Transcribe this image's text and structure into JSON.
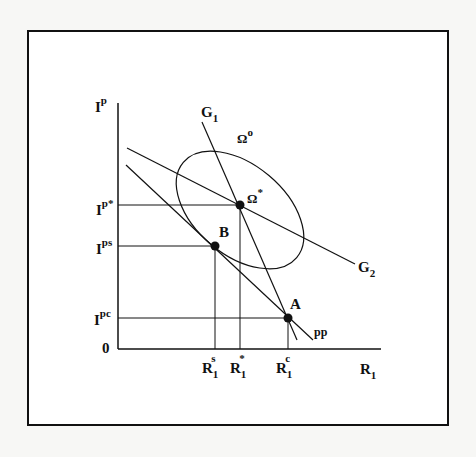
{
  "diagram": {
    "type": "economic-equilibrium-diagram",
    "axes": {
      "y_label": {
        "base": "I",
        "sup": "p"
      },
      "x_label": {
        "base": "R",
        "sub": "1"
      },
      "origin_label": "0"
    },
    "y_ticks": [
      {
        "id": "I_p_star",
        "base": "I",
        "sup": "p*"
      },
      {
        "id": "I_ps",
        "base": "I",
        "sup": "ps"
      },
      {
        "id": "I_pc",
        "base": "I",
        "sup": "pc"
      }
    ],
    "x_ticks": [
      {
        "id": "R1_s",
        "base": "R",
        "sub": "1",
        "sup": "s"
      },
      {
        "id": "R1_star",
        "base": "R",
        "sub": "1",
        "sup": "*"
      },
      {
        "id": "R1_c",
        "base": "R",
        "sub": "1",
        "sup": "c"
      }
    ],
    "curves": [
      {
        "id": "G1",
        "base": "G",
        "sub": "1",
        "kind": "line"
      },
      {
        "id": "G2",
        "base": "G",
        "sub": "2",
        "kind": "line"
      },
      {
        "id": "pp",
        "label": "pp",
        "kind": "line"
      },
      {
        "id": "Omega_o",
        "base": "Ω",
        "sup": "o",
        "kind": "ellipse"
      }
    ],
    "points": [
      {
        "id": "Omega_star",
        "base": "Ω",
        "sup": "*"
      },
      {
        "id": "B",
        "label": "B"
      },
      {
        "id": "A",
        "label": "A"
      }
    ],
    "colors": {
      "ink": "#111111",
      "background": "#f7f7f5",
      "frame": "#111111"
    }
  }
}
